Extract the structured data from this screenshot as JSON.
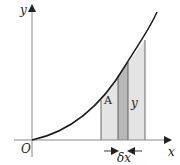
{
  "diagram": {
    "labels": {
      "y_axis": "y",
      "x_axis": "x",
      "origin": "O",
      "point": "A",
      "strip_height": "y",
      "strip_width": "δx"
    },
    "colors": {
      "axis": "#888888",
      "curve": "#1a1a1a",
      "region_fill": "#e4e4e4",
      "strip_fill": "#b8b8b8",
      "edge_lines": "#333333"
    }
  }
}
